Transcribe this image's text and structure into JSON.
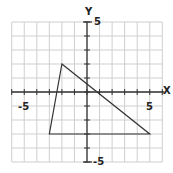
{
  "diagram": {
    "type": "coordinate-plane-triangle",
    "axes": {
      "x_label": "X",
      "y_label": "Y",
      "x_tick_labels": [
        {
          "value": -5,
          "text": "-5"
        },
        {
          "value": 5,
          "text": "5"
        }
      ],
      "y_tick_labels": [
        {
          "value": 5,
          "text": "5"
        },
        {
          "value": -5,
          "text": "-5"
        }
      ],
      "grid_x_range": [
        -6,
        6
      ],
      "grid_y_range": [
        -5,
        5
      ]
    },
    "triangle": {
      "vertices": [
        {
          "x": -2,
          "y": 2
        },
        {
          "x": 5,
          "y": -3
        },
        {
          "x": -3,
          "y": -3
        }
      ],
      "stroke_color": "#333333"
    },
    "colors": {
      "grid": "#cfcfcf",
      "axis": "#333333"
    }
  }
}
